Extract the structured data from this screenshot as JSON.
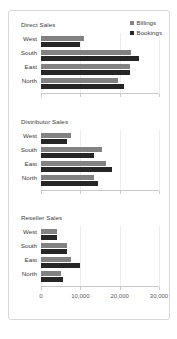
{
  "chart_data": {
    "type": "bar",
    "orientation": "horizontal",
    "title": "",
    "xlabel": "",
    "ylabel": "",
    "xlim": [
      0,
      30000
    ],
    "xticks": [
      0,
      10000,
      20000,
      30000
    ],
    "xtick_labels": [
      "0",
      "10,000",
      "20,000",
      "30,000"
    ],
    "grid": true,
    "legend_position": "top-right",
    "categories": [
      "West",
      "South",
      "East",
      "North"
    ],
    "legend": [
      {
        "name": "Billings",
        "color": "#828282",
        "marker": "square"
      },
      {
        "name": "Bookings",
        "color": "#262626",
        "marker": "square"
      }
    ],
    "panels": [
      {
        "title": "Direct Sales",
        "series": [
          {
            "name": "Billings",
            "color": "#828282",
            "values": [
              11000,
              23000,
              22500,
              19500
            ]
          },
          {
            "name": "Bookings",
            "color": "#262626",
            "values": [
              10000,
              25000,
              22500,
              21000
            ]
          }
        ]
      },
      {
        "title": "Distributor Sales",
        "series": [
          {
            "name": "Billings",
            "color": "#828282",
            "values": [
              7500,
              15500,
              16500,
              13500
            ]
          },
          {
            "name": "Bookings",
            "color": "#262626",
            "values": [
              6500,
              13500,
              18000,
              14500
            ]
          }
        ]
      },
      {
        "title": "Reseller Sales",
        "series": [
          {
            "name": "Billings",
            "color": "#828282",
            "values": [
              4000,
              6500,
              7500,
              5000
            ]
          },
          {
            "name": "Bookings",
            "color": "#262626",
            "values": [
              4000,
              6500,
              10000,
              5500
            ]
          }
        ]
      }
    ]
  }
}
